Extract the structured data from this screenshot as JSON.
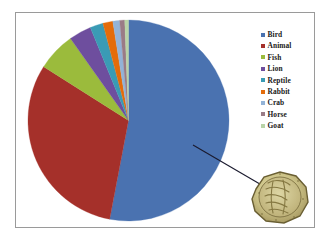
{
  "chart_data": {
    "type": "pie",
    "title": "",
    "subtitle": "",
    "xlabel": "",
    "ylabel": "",
    "grid": false,
    "legend_position": "right",
    "categories": [
      "Bird",
      "Animal",
      "Fish",
      "Lion",
      "Reptile",
      "Rabbit",
      "Crab",
      "Horse",
      "Goat"
    ],
    "values": [
      53.0,
      31.0,
      6.2,
      3.6,
      2.1,
      1.6,
      1.1,
      0.8,
      0.6
    ],
    "colors": [
      "#4a72b0",
      "#a5302a",
      "#9bbb3c",
      "#6e4e9e",
      "#3a9bb5",
      "#e46c0a",
      "#93b3d7",
      "#9a7b86",
      "#b9d4a8"
    ],
    "series": [
      {
        "name": "Animal depictions",
        "values": [
          53.0,
          31.0,
          6.2,
          3.6,
          2.1,
          1.6,
          1.1,
          0.8,
          0.6
        ]
      }
    ],
    "annotations": [
      {
        "name": "callout-line",
        "target_slice": "Bird",
        "description": "leader line from Bird slice to inset artifact photograph"
      }
    ]
  },
  "legend": {
    "items": [
      {
        "label": "Bird",
        "color": "#4a72b0"
      },
      {
        "label": "Animal",
        "color": "#a5302a"
      },
      {
        "label": "Fish",
        "color": "#9bbb3c"
      },
      {
        "label": "Lion",
        "color": "#6e4e9e"
      },
      {
        "label": "Reptile",
        "color": "#3a9bb5"
      },
      {
        "label": "Rabbit",
        "color": "#e46c0a"
      },
      {
        "label": "Crab",
        "color": "#93b3d7"
      },
      {
        "label": "Horse",
        "color": "#9a7b86"
      },
      {
        "label": "Goat",
        "color": "#b9d4a8"
      }
    ]
  },
  "inset": {
    "caption": "",
    "alt": "photograph of a carved stone seal artifact"
  },
  "style": {
    "border_color": "#9a9a9a",
    "background": "#ffffff"
  }
}
